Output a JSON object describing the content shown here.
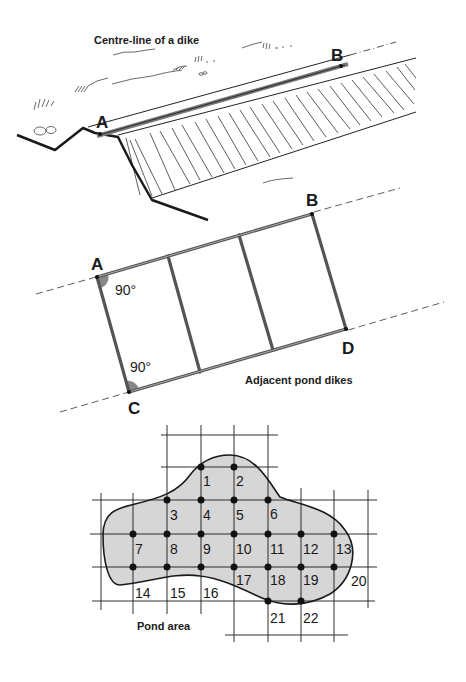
{
  "figure_1": {
    "caption": "Centre-line of a dike",
    "point_a": "A",
    "point_b": "B"
  },
  "figure_2": {
    "caption": "Adjacent pond dikes",
    "point_a": "A",
    "point_b": "B",
    "point_c": "C",
    "point_d": "D",
    "angle_a": "90°",
    "angle_c": "90°"
  },
  "figure_3": {
    "caption": "Pond area",
    "grid_points": [
      {
        "label": "1",
        "x": 201,
        "y": 467
      },
      {
        "label": "2",
        "x": 234,
        "y": 467
      },
      {
        "label": "3",
        "x": 167,
        "y": 500
      },
      {
        "label": "4",
        "x": 201,
        "y": 500
      },
      {
        "label": "5",
        "x": 234,
        "y": 500
      },
      {
        "label": "6",
        "x": 268,
        "y": 500
      },
      {
        "label": "7",
        "x": 133,
        "y": 534
      },
      {
        "label": "8",
        "x": 167,
        "y": 534
      },
      {
        "label": "9",
        "x": 201,
        "y": 534
      },
      {
        "label": "10",
        "x": 234,
        "y": 534
      },
      {
        "label": "11",
        "x": 268,
        "y": 534
      },
      {
        "label": "12",
        "x": 301,
        "y": 534
      },
      {
        "label": "13",
        "x": 334,
        "y": 534
      },
      {
        "label": "14",
        "x": 133,
        "y": 567
      },
      {
        "label": "15",
        "x": 167,
        "y": 567
      },
      {
        "label": "16",
        "x": 201,
        "y": 567
      },
      {
        "label": "17",
        "x": 234,
        "y": 567
      },
      {
        "label": "18",
        "x": 268,
        "y": 567
      },
      {
        "label": "19",
        "x": 301,
        "y": 567
      },
      {
        "label": "20",
        "x": 334,
        "y": 567
      },
      {
        "label": "21",
        "x": 268,
        "y": 601
      },
      {
        "label": "22",
        "x": 301,
        "y": 601
      }
    ]
  }
}
